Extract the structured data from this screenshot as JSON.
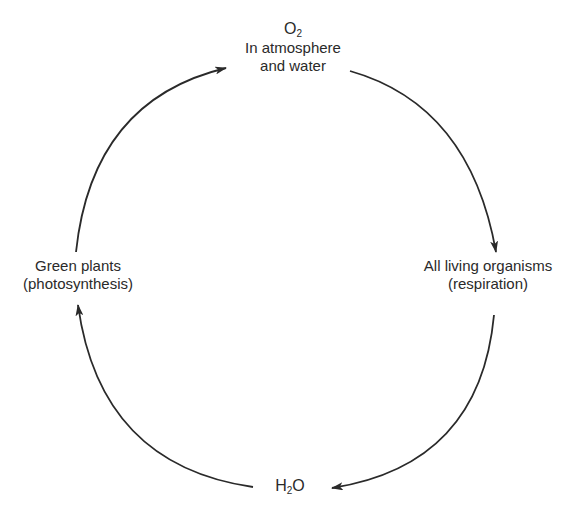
{
  "diagram": {
    "type": "cycle",
    "title": "",
    "nodes": {
      "top": {
        "formula_base": "O",
        "formula_sub": "2",
        "line1": "In atmosphere",
        "line2": "and water"
      },
      "right": {
        "line1": "All living organisms",
        "line2": "(respiration)"
      },
      "bottom": {
        "formula_base": "H",
        "formula_sub": "2",
        "formula_tail": "O"
      },
      "left": {
        "line1": "Green plants",
        "line2": "(photosynthesis)"
      }
    },
    "edges": [
      {
        "from": "top",
        "to": "right",
        "direction": "clockwise"
      },
      {
        "from": "right",
        "to": "bottom",
        "direction": "clockwise"
      },
      {
        "from": "bottom",
        "to": "left",
        "direction": "clockwise"
      },
      {
        "from": "left",
        "to": "top",
        "direction": "clockwise"
      }
    ],
    "colors": {
      "stroke": "#2a2a2a",
      "background": "#ffffff"
    }
  }
}
